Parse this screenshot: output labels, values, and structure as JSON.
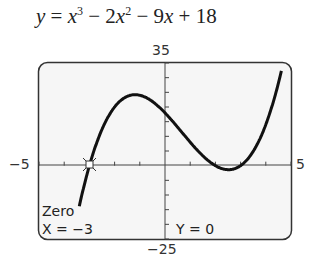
{
  "header": {
    "equation": "y = x³ − 2x² − 9x + 18"
  },
  "window": {
    "ymax_label": "35",
    "ymin_label": "−25",
    "xmin_label": "−5",
    "xmax_label": "5"
  },
  "screen": {
    "mode": "Zero",
    "x_readout": "X = −3",
    "y_readout": "Y = 0"
  },
  "chart_data": {
    "type": "line",
    "function": "x^3 - 2x^2 - 9x + 18",
    "xlim": [
      -5,
      5
    ],
    "ylim": [
      -25,
      35
    ],
    "x": [
      -3.4,
      -3,
      -2,
      -1,
      -0.7,
      0,
      1,
      2,
      2.3,
      3,
      4,
      4.6
    ],
    "y": [
      -11.3,
      0,
      20,
      24,
      24,
      18,
      8,
      -4,
      -4.5,
      0,
      14,
      31.3
    ],
    "xscale": 1,
    "yscale": 5,
    "annotations": [
      {
        "label": "Zero",
        "x": -3,
        "y": 0
      }
    ],
    "grid": false,
    "legend": null
  }
}
